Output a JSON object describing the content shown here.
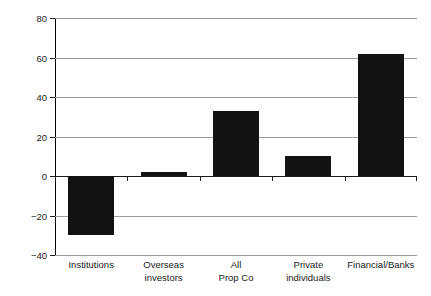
{
  "chart_data": {
    "type": "bar",
    "title": "",
    "xlabel": "",
    "ylabel": "Differential (bps)",
    "categories": [
      "Institutions",
      "Overseas investors",
      "All Prop Co",
      "Private individuals",
      "Financial/Banks"
    ],
    "category_lines": [
      [
        "Institutions"
      ],
      [
        "Overseas",
        "investors"
      ],
      [
        "All",
        "Prop Co"
      ],
      [
        "Private",
        "individuals"
      ],
      [
        "Financial/Banks"
      ]
    ],
    "values": [
      -30,
      2,
      33,
      10,
      62
    ],
    "ylim": [
      -40,
      80
    ],
    "yticks": [
      80,
      60,
      40,
      20,
      0,
      -20,
      -40
    ],
    "ytick_labels": [
      "80",
      "60",
      "40",
      "20",
      "0",
      "−20",
      "−40"
    ],
    "grid": true,
    "legend": false,
    "bar_color": "#121212",
    "grid_color": "#9a9a9a",
    "axis_color": "#1b1b1b",
    "background": "#ffffff"
  }
}
